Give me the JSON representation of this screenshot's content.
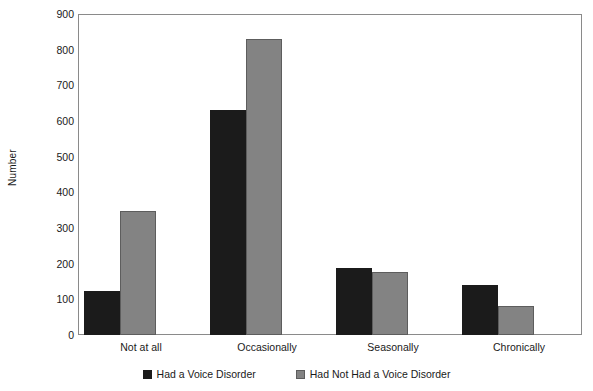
{
  "chart_data": {
    "type": "bar",
    "title": "",
    "xlabel": "",
    "ylabel": "Number",
    "categories": [
      "Not at all",
      "Occasionally",
      "Seasonally",
      "Chronically"
    ],
    "series": [
      {
        "name": "Had a Voice Disorder",
        "color": "#1b1b1b",
        "values": [
          123,
          630,
          188,
          140
        ]
      },
      {
        "name": "Had Not Had a Voice Disorder",
        "color": "#838383",
        "values": [
          348,
          830,
          177,
          80
        ]
      }
    ],
    "ylim": [
      0,
      900
    ],
    "yticks": [
      0,
      100,
      200,
      300,
      400,
      500,
      600,
      700,
      800,
      900
    ],
    "ytick_labels": [
      "0",
      "100",
      "200",
      "300",
      "400",
      "500",
      "600",
      "700",
      "800",
      "900"
    ],
    "grid": false,
    "legend_position": "bottom"
  }
}
